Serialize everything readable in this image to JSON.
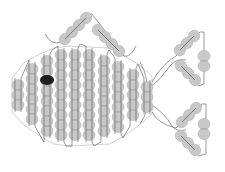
{
  "diagram": {
    "title": "",
    "colors": {
      "background": "#ffffff",
      "bead_fill": "#c8c8c8",
      "bead_stroke": "#b4b4b4",
      "thread": "#555555",
      "eye": "#1e1e1e"
    },
    "bead": {
      "w": 12,
      "h": 10
    },
    "body_columns": [
      {
        "x": 18,
        "y_top": 80,
        "count": 3
      },
      {
        "x": 32,
        "y_top": 64,
        "count": 6
      },
      {
        "x": 47,
        "y_top": 56,
        "count": 8
      },
      {
        "x": 61,
        "y_top": 50,
        "count": 9
      },
      {
        "x": 75,
        "y_top": 50,
        "count": 9
      },
      {
        "x": 89,
        "y_top": 50,
        "count": 9
      },
      {
        "x": 104,
        "y_top": 56,
        "count": 8
      },
      {
        "x": 118,
        "y_top": 62,
        "count": 7
      },
      {
        "x": 133,
        "y_top": 70,
        "count": 5
      },
      {
        "x": 147,
        "y_top": 82,
        "count": 3
      }
    ],
    "eye": {
      "x": 47,
      "y": 80,
      "rx": 7,
      "ry": 5
    },
    "top_fin": {
      "left_arm": [
        {
          "x": 86,
          "y": 18
        },
        {
          "x": 79,
          "y": 25
        },
        {
          "x": 72,
          "y": 32
        },
        {
          "x": 65,
          "y": 39
        }
      ],
      "right_arm": [
        {
          "x": 98,
          "y": 30
        },
        {
          "x": 105,
          "y": 37
        },
        {
          "x": 112,
          "y": 44
        },
        {
          "x": 119,
          "y": 51
        }
      ]
    },
    "tail_upper": {
      "arm_a": [
        {
          "x": 194,
          "y": 36
        },
        {
          "x": 187,
          "y": 43
        },
        {
          "x": 180,
          "y": 50
        }
      ],
      "arm_b": [
        {
          "x": 181,
          "y": 66
        },
        {
          "x": 188,
          "y": 73
        },
        {
          "x": 195,
          "y": 80
        }
      ],
      "pair": [
        {
          "x": 204,
          "y": 56
        },
        {
          "x": 204,
          "y": 66
        }
      ]
    },
    "tail_lower": {
      "arm_a": [
        {
          "x": 196,
          "y": 108
        },
        {
          "x": 189,
          "y": 115
        },
        {
          "x": 182,
          "y": 122
        }
      ],
      "arm_b": [
        {
          "x": 181,
          "y": 136
        },
        {
          "x": 188,
          "y": 143
        },
        {
          "x": 195,
          "y": 150
        }
      ],
      "pair": [
        {
          "x": 204,
          "y": 124
        },
        {
          "x": 204,
          "y": 134
        }
      ]
    }
  }
}
